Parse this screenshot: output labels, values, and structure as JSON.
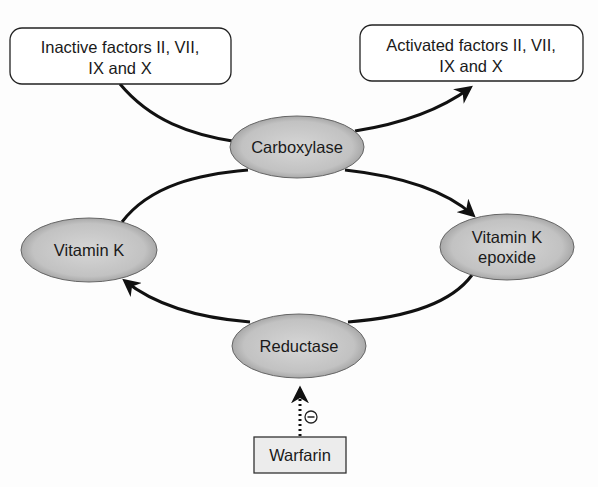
{
  "diagram": {
    "nodes": {
      "inactive_factors": {
        "lines": [
          "Inactive factors II, VII,",
          "IX and X"
        ],
        "shape": "rounded-rect"
      },
      "activated_factors": {
        "lines": [
          "Activated factors II, VII,",
          "IX and X"
        ],
        "shape": "rounded-rect"
      },
      "carboxylase": {
        "lines": [
          "Carboxylase"
        ],
        "shape": "ellipse"
      },
      "vitamin_k": {
        "lines": [
          "Vitamin K"
        ],
        "shape": "ellipse"
      },
      "vitamin_k_epoxide": {
        "lines": [
          "Vitamin K",
          "epoxide"
        ],
        "shape": "ellipse"
      },
      "reductase": {
        "lines": [
          "Reductase"
        ],
        "shape": "ellipse"
      },
      "warfarin": {
        "lines": [
          "Warfarin"
        ],
        "shape": "rect"
      }
    },
    "edges": [
      {
        "from": "inactive_factors",
        "to": "carboxylase",
        "style": "solid",
        "arrow": false
      },
      {
        "from": "carboxylase",
        "to": "activated_factors",
        "style": "solid",
        "arrow": true
      },
      {
        "from": "carboxylase",
        "to": "vitamin_k_epoxide",
        "style": "solid",
        "arrow": true
      },
      {
        "from": "vitamin_k",
        "to": "carboxylase",
        "style": "solid",
        "arrow": false
      },
      {
        "from": "vitamin_k_epoxide",
        "to": "reductase",
        "style": "solid",
        "arrow": false
      },
      {
        "from": "reductase",
        "to": "vitamin_k",
        "style": "solid",
        "arrow": true
      },
      {
        "from": "warfarin",
        "to": "reductase",
        "style": "dotted",
        "arrow": true,
        "label": "⊖"
      }
    ],
    "inhibition_symbol": "⊖",
    "colors": {
      "node_fill": "#c4c4c4",
      "stroke": "#111111",
      "box_fill": "#ffffff",
      "warfarin_fill": "#ececec"
    }
  }
}
